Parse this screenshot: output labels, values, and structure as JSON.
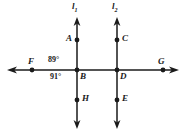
{
  "figure": {
    "type": "geometry-diagram",
    "background_color": "#ffffff",
    "stroke_color": "#1a1a1a"
  },
  "lines": [
    {
      "name": "line-l1",
      "label": "l",
      "subscript": "1",
      "orientation": "vertical",
      "x": 77,
      "y_top": 18,
      "y_bottom": 128,
      "label_x": 72,
      "label_y": 3
    },
    {
      "name": "line-l2",
      "label": "l",
      "subscript": "2",
      "orientation": "vertical",
      "x": 117,
      "y_top": 18,
      "y_bottom": 128,
      "label_x": 112,
      "label_y": 3
    },
    {
      "name": "transversal-fg",
      "label": "",
      "subscript": "",
      "orientation": "horizontal",
      "y": 70,
      "x_left": 8,
      "x_right": 178
    }
  ],
  "points": [
    {
      "name": "point-a",
      "label": "A",
      "x": 77,
      "y": 40,
      "label_x": 66,
      "label_y": 35
    },
    {
      "name": "point-c",
      "label": "C",
      "x": 117,
      "y": 40,
      "label_x": 122,
      "label_y": 35
    },
    {
      "name": "point-f",
      "label": "F",
      "x": 32,
      "y": 70,
      "label_x": 28,
      "label_y": 58
    },
    {
      "name": "point-b",
      "label": "B",
      "x": 77,
      "y": 70,
      "label_x": 80,
      "label_y": 72
    },
    {
      "name": "point-d",
      "label": "D",
      "x": 117,
      "y": 70,
      "label_x": 120,
      "label_y": 72
    },
    {
      "name": "point-g",
      "label": "G",
      "x": 163,
      "y": 70,
      "label_x": 159,
      "label_y": 58
    },
    {
      "name": "point-h",
      "label": "H",
      "x": 77,
      "y": 100,
      "label_x": 82,
      "label_y": 95
    },
    {
      "name": "point-e",
      "label": "E",
      "x": 117,
      "y": 100,
      "label_x": 122,
      "label_y": 95
    }
  ],
  "angles": [
    {
      "name": "angle-89",
      "value": "89°",
      "position": "above-left-of-B",
      "x": 48,
      "y": 57
    },
    {
      "name": "angle-91",
      "value": "91°",
      "position": "below-left-of-B",
      "x": 50,
      "y": 73
    }
  ]
}
